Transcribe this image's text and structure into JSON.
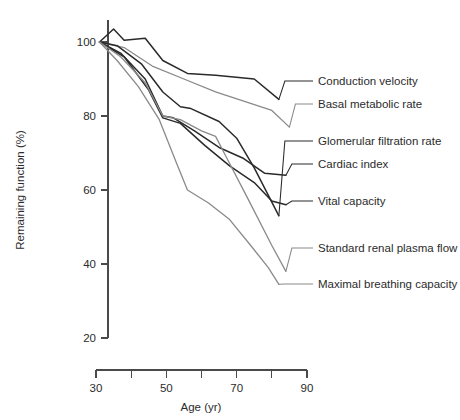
{
  "chart_data": {
    "type": "line",
    "title": "",
    "xlabel": "Age (yr)",
    "ylabel": "Remaining function (%)",
    "xlim": [
      30,
      90
    ],
    "ylim": [
      20,
      105
    ],
    "grid": false,
    "legend_position": "right-leader-labels",
    "x_ticks_major": [
      30,
      50,
      70,
      90
    ],
    "x_ticks_minor": [
      40,
      60,
      80
    ],
    "y_ticks": [
      100,
      80,
      60,
      40,
      20
    ],
    "x_tick_labels": [
      "30",
      "50",
      "70",
      "90"
    ],
    "y_tick_labels": [
      "100",
      "80",
      "60",
      "40",
      "20"
    ],
    "series": [
      {
        "name": "Conduction velocity",
        "color": "#2a2a2a",
        "label_y_pct": 85,
        "x": [
          31,
          35,
          38,
          44,
          49,
          56,
          64,
          75,
          82
        ],
        "values": [
          100,
          103.5,
          100.5,
          101,
          95,
          91.5,
          91,
          90,
          84.5
        ]
      },
      {
        "name": "Basal metabolic rate",
        "color": "#8a8a8a",
        "label_y_pct": 108,
        "x": [
          31,
          38,
          46,
          55,
          64,
          72,
          80,
          85
        ],
        "values": [
          100,
          98.5,
          93.5,
          90,
          86.5,
          84,
          81.5,
          77
        ]
      },
      {
        "name": "Glomerular filtration rate",
        "color": "#2a2a2a",
        "label_y_pct": 145,
        "x": [
          31,
          36,
          43,
          49,
          54,
          57,
          65,
          70,
          75,
          82
        ],
        "values": [
          100,
          99,
          94,
          86.5,
          82.5,
          82,
          78.5,
          74,
          66,
          53
        ]
      },
      {
        "name": "Cardiac index",
        "color": "#2a2a2a",
        "label_y_pct": 168,
        "x": [
          31,
          37,
          44,
          49,
          52,
          58,
          65,
          72,
          78,
          84
        ],
        "values": [
          100,
          97,
          90,
          80,
          79.5,
          76,
          71.5,
          68.5,
          64.5,
          64
        ]
      },
      {
        "name": "Vital capacity",
        "color": "#2a2a2a",
        "label_y_pct": 205,
        "x": [
          31,
          38,
          45,
          49,
          54,
          61,
          68,
          75,
          80,
          84
        ],
        "values": [
          100,
          96,
          87,
          79.5,
          78,
          72,
          66.5,
          62,
          57,
          56
        ]
      },
      {
        "name": "Standard renal plasma flow",
        "color": "#8a8a8a",
        "label_y_pct": 252,
        "x": [
          31,
          37,
          44,
          49,
          54,
          60,
          64,
          67,
          73,
          80,
          84
        ],
        "values": [
          100,
          96,
          89,
          80,
          79,
          76,
          74.5,
          69,
          58,
          45,
          38
        ]
      },
      {
        "name": "Maximal breathing capacity",
        "color": "#8a8a8a",
        "label_y_pct": 288,
        "x": [
          31,
          36,
          42,
          48,
          53,
          56,
          62,
          68,
          74,
          79,
          82
        ],
        "values": [
          100,
          95,
          88,
          79,
          67,
          60,
          56.5,
          52,
          45,
          39,
          34.5
        ]
      }
    ]
  },
  "axes": {
    "y_title": "Remaining function (%)",
    "x_title": "Age (yr)",
    "y_labels": [
      "100",
      "80",
      "60",
      "40",
      "20"
    ],
    "x_labels": [
      "30",
      "50",
      "70",
      "90"
    ]
  },
  "labels": {
    "conduction_velocity": "Conduction velocity",
    "basal_metabolic_rate": "Basal metabolic rate",
    "glomerular_filtration_rate": "Glomerular filtration rate",
    "cardiac_index": "Cardiac index",
    "vital_capacity": "Vital capacity",
    "standard_renal_plasma_flow": "Standard renal plasma flow",
    "maximal_breathing_capacity": "Maximal breathing capacity"
  },
  "colors": {
    "dark_line": "#2a2a2a",
    "gray_line": "#8a8a8a",
    "axis": "#4a4a4a",
    "text": "#2b2b2b",
    "background": "#ffffff"
  }
}
